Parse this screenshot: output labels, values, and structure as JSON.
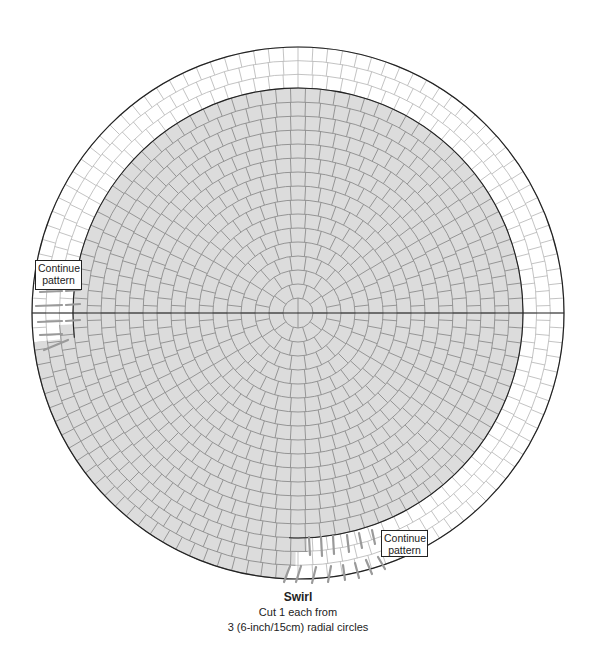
{
  "diagram": {
    "center": [
      298,
      313
    ],
    "ring_width": 14,
    "inner_radius": 15,
    "gray_rings": 16,
    "outer_rings": 3,
    "outer_radius": 266,
    "colors": {
      "gray_fill": "#dcdcdc",
      "tile_line": "#8c8c8c",
      "white_tile_line": "#b4b4b4",
      "outline": "#222222",
      "cut_line": "#9a9a9a",
      "background": "#ffffff"
    }
  },
  "labels": {
    "left_box": {
      "line1": "Continue",
      "line2": "pattern"
    },
    "right_box": {
      "line1": "Continue",
      "line2": "pattern"
    }
  },
  "caption": {
    "title": "Swirl",
    "line1": "Cut 1 each from",
    "line2": "3 (6-inch/15cm) radial circles"
  }
}
